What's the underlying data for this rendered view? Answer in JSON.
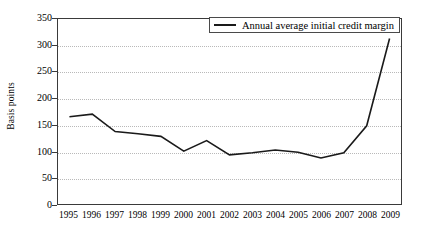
{
  "chart_data": {
    "type": "line",
    "title": "",
    "xlabel": "",
    "ylabel": "Basis points",
    "ylim": [
      0,
      350
    ],
    "ytick_step": 50,
    "yticks": [
      0,
      50,
      100,
      150,
      200,
      250,
      300,
      350
    ],
    "grid": true,
    "legend_position": "top-right",
    "categories": [
      "1995",
      "1996",
      "1997",
      "1998",
      "1999",
      "2000",
      "2001",
      "2002",
      "2003",
      "2004",
      "2005",
      "2006",
      "2007",
      "2008",
      "2009"
    ],
    "series": [
      {
        "name": "Annual average initial credit margin",
        "color": "#1a1a1a",
        "values": [
          165,
          170,
          137,
          133,
          128,
          100,
          120,
          93,
          97,
          102,
          98,
          87,
          97,
          148,
          313
        ]
      }
    ]
  },
  "axes": {
    "y_title": "Basis points"
  },
  "legend": {
    "entries": [
      {
        "label": "Annual average initial credit margin"
      }
    ]
  },
  "colors": {
    "line": "#1a1a1a",
    "frame": "#3a3a3a",
    "grid": "#b9b9b9",
    "background": "#ffffff"
  }
}
